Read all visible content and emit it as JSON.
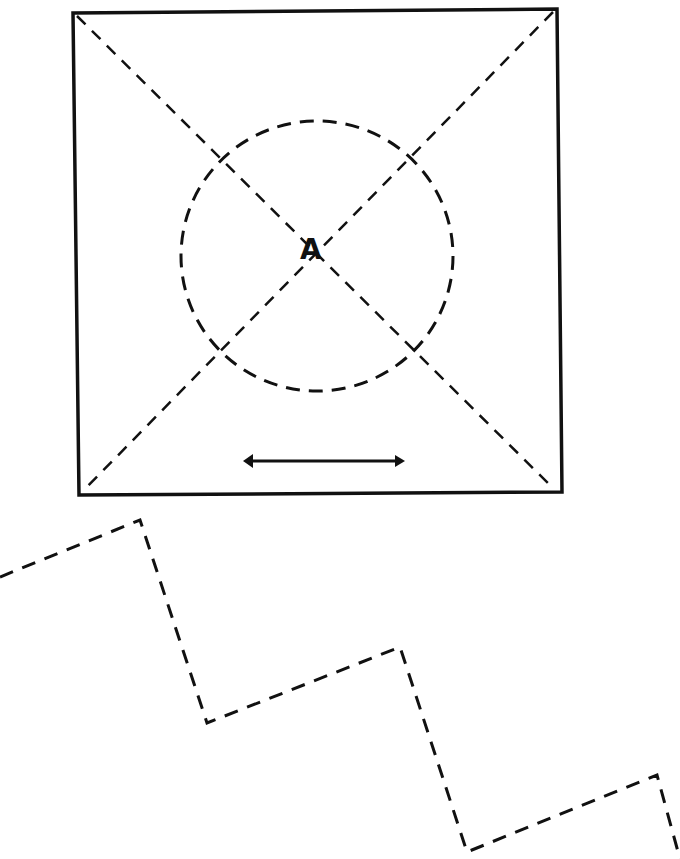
{
  "diagram": {
    "center_label": "A",
    "stroke_color": "#111111",
    "background": "#ffffff",
    "square": {
      "corners": [
        [
          73,
          13
        ],
        [
          557,
          9
        ],
        [
          562,
          492
        ],
        [
          79,
          495
        ]
      ]
    },
    "diagonals": [
      {
        "from": [
          77,
          16
        ],
        "to": [
          554,
          489
        ]
      },
      {
        "from": [
          553,
          12
        ],
        "to": [
          83,
          491
        ]
      }
    ],
    "circle": {
      "cx": 317,
      "cy": 256,
      "rx": 136,
      "ry": 135
    },
    "arrow": {
      "type": "double-headed",
      "from": [
        243,
        461
      ],
      "to": [
        405,
        461
      ]
    },
    "zigzag": {
      "points": [
        [
          0,
          577
        ],
        [
          140,
          520
        ],
        [
          207,
          723
        ],
        [
          400,
          647
        ],
        [
          467,
          852
        ],
        [
          657,
          775
        ],
        [
          680,
          859
        ]
      ]
    }
  }
}
